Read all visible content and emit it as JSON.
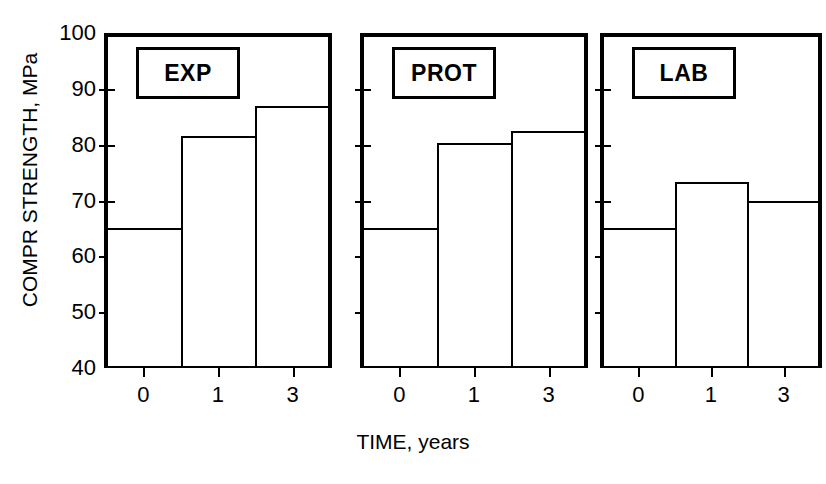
{
  "chart_data": {
    "type": "bar",
    "title": "",
    "xlabel": "TIME, years",
    "ylabel": "COMPR STRENGTH, MPa",
    "ylim": [
      40,
      100
    ],
    "yticks": [
      100,
      90,
      80,
      70,
      60,
      50,
      40
    ],
    "categories": [
      "0",
      "1",
      "3"
    ],
    "grid": false,
    "legend": "none",
    "panels": [
      {
        "tag": "EXP",
        "categories": [
          "0",
          "1",
          "3"
        ],
        "values": [
          65,
          81.5,
          87
        ]
      },
      {
        "tag": "PROT",
        "categories": [
          "0",
          "1",
          "3"
        ],
        "values": [
          65,
          80.3,
          82.5
        ]
      },
      {
        "tag": "LAB",
        "categories": [
          "0",
          "1",
          "3"
        ],
        "values": [
          65,
          73.3,
          70
        ]
      }
    ]
  }
}
